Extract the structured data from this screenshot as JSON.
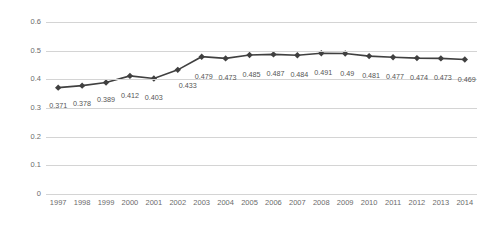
{
  "chart_data": {
    "type": "line",
    "title": "",
    "subtitle": "",
    "xlabel": "",
    "ylabel": "",
    "categories": [
      "1997",
      "1998",
      "1999",
      "2000",
      "2001",
      "2002",
      "2003",
      "2004",
      "2005",
      "2006",
      "2007",
      "2008",
      "2009",
      "2010",
      "2011",
      "2012",
      "2013",
      "2014"
    ],
    "values": [
      0.371,
      0.378,
      0.389,
      0.412,
      0.403,
      0.433,
      0.479,
      0.473,
      0.485,
      0.487,
      0.484,
      0.491,
      0.49,
      0.481,
      0.477,
      0.474,
      0.473,
      0.469
    ],
    "data_labels": [
      "0.371",
      "0.378",
      "0.389",
      "0.412",
      "0.403",
      "0.433",
      "0.479",
      "0.473",
      "0.485",
      "0.487",
      "0.484",
      "0.491",
      "0.49",
      "0.481",
      "0.477",
      "0.474",
      "0.473",
      "0.469"
    ],
    "ylim": [
      0,
      0.6
    ],
    "yticks": [
      0,
      0.1,
      0.2,
      0.3,
      0.4,
      0.5,
      0.6
    ],
    "ytick_labels": [
      "0",
      "0.1",
      "0.2",
      "0.3",
      "0.4",
      "0.5",
      "0.6"
    ],
    "grid": true,
    "legend": "none",
    "series_color": "#404040",
    "gridline_color": "#d4d4d4",
    "label_color": "#6b6b6b",
    "background_color": "#ffffff",
    "marker": "diamond"
  }
}
